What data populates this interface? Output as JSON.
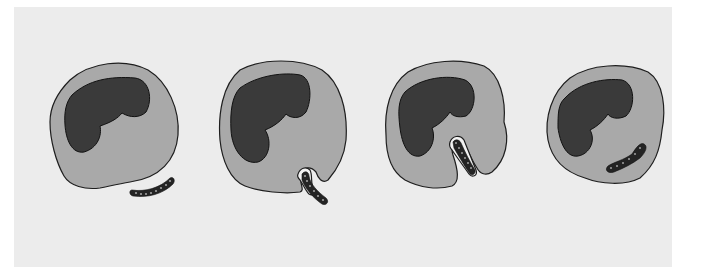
{
  "figure": {
    "background_color": "#ececec",
    "cytoplasm_color": "#a9a9a9",
    "nucleus_color": "#3a3a3a",
    "stages": [
      {
        "index": 1,
        "name": "attachment",
        "bacterium_position": "outside, adjacent to cell membrane"
      },
      {
        "index": 2,
        "name": "invagination",
        "bacterium_position": "partly enclosed by membrane fold"
      },
      {
        "index": 3,
        "name": "engulfment",
        "bacterium_position": "enclosed in deep membrane pocket"
      },
      {
        "index": 4,
        "name": "internalized",
        "bacterium_position": "inside cytoplasm"
      }
    ]
  }
}
